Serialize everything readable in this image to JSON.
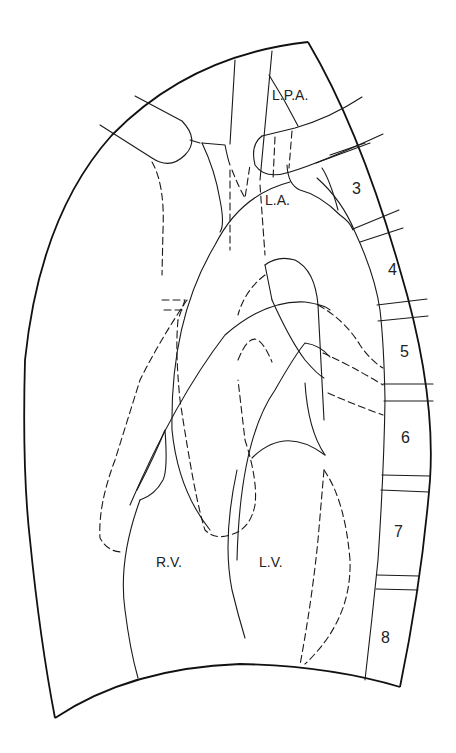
{
  "diagram": {
    "type": "anatomical line drawing",
    "line_color": "#1a1a1a",
    "background": "#ffffff",
    "legend": {
      "solid_lines": "visible structures",
      "dashed_lines": "hidden / projected structures"
    },
    "chamber_labels": [
      {
        "id": "lpa",
        "text": "L.P.A.",
        "x": 272,
        "y": 88
      },
      {
        "id": "la",
        "text": "L.A.",
        "x": 265,
        "y": 193
      },
      {
        "id": "rv",
        "text": "R.V.",
        "x": 156,
        "y": 555
      },
      {
        "id": "lv",
        "text": "L.V.",
        "x": 259,
        "y": 555
      }
    ],
    "rib_labels": [
      {
        "id": "rib-3",
        "text": "3",
        "x": 352,
        "y": 181
      },
      {
        "id": "rib-4",
        "text": "4",
        "x": 388,
        "y": 262
      },
      {
        "id": "rib-5",
        "text": "5",
        "x": 400,
        "y": 344
      },
      {
        "id": "rib-6",
        "text": "6",
        "x": 401,
        "y": 430
      },
      {
        "id": "rib-7",
        "text": "7",
        "x": 394,
        "y": 524
      },
      {
        "id": "rib-8",
        "text": "8",
        "x": 381,
        "y": 630
      }
    ]
  }
}
